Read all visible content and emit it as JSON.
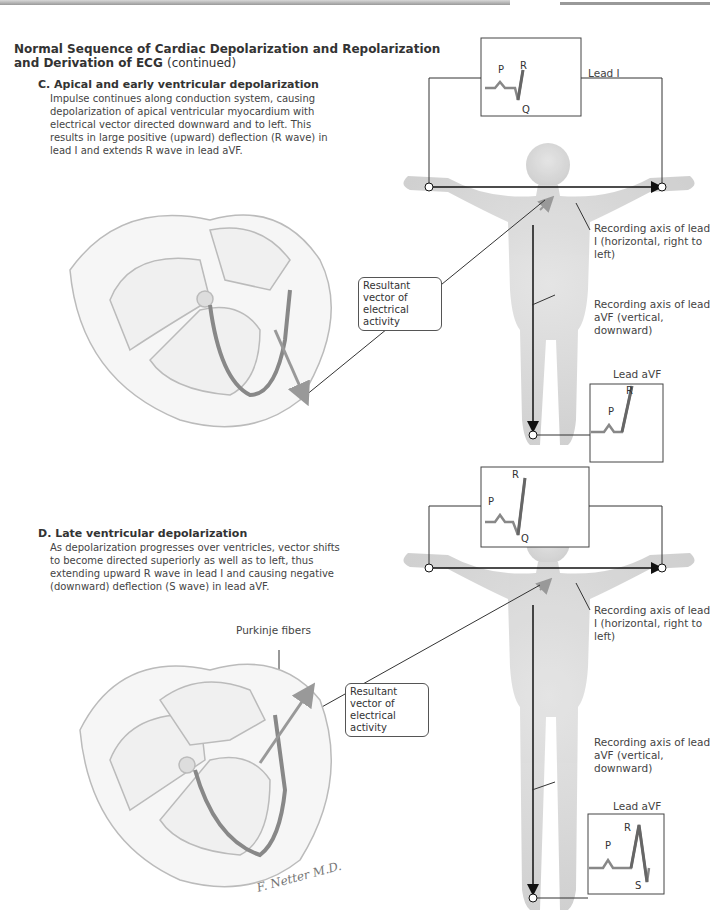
{
  "header": {
    "title_line1": "Normal Sequence of Cardiac Depolarization and Repolarization",
    "title_line2": "and Derivation of ECG",
    "title_suffix": "(continued)"
  },
  "panels": [
    {
      "heading": "C. Apical and early ventricular depolarization",
      "body": "Impulse continues along conduction system, causing depolarization of apical ventricular myocardium with electrical vector directed downward and to left. This results in large positive (upward) deflection (R wave) in lead I and extends R wave in lead aVF.",
      "lead_I": {
        "label": "Lead I",
        "waves": [
          "P",
          "R",
          "Q"
        ]
      },
      "lead_aVF": {
        "label": "Lead aVF",
        "waves": [
          "P",
          "R"
        ]
      },
      "callout_vector": "Resultant vector of electrical activity",
      "axis_lead_I": "Recording axis of lead I (horizontal, right to left)",
      "axis_lead_aVF": "Recording axis of lead aVF (vertical, downward)"
    },
    {
      "heading": "D. Late ventricular depolarization",
      "body": "As depolarization progresses over ventricles, vector shifts to become directed superiorly as well as to left, thus extending upward R wave in lead I and causing negative (downward) deflection (S wave) in lead aVF.",
      "lead_I": {
        "label": "",
        "waves": [
          "P",
          "R",
          "Q"
        ]
      },
      "lead_aVF": {
        "label": "Lead aVF",
        "waves": [
          "P",
          "R",
          "S"
        ]
      },
      "callout_vector": "Resultant vector of electrical activity",
      "purkinje_label": "Purkinje fibers",
      "axis_lead_I": "Recording axis of lead I (horizontal, right to left)",
      "axis_lead_aVF": "Recording axis of lead aVF (vertical, downward)"
    }
  ],
  "signature": "F. Netter M.D."
}
